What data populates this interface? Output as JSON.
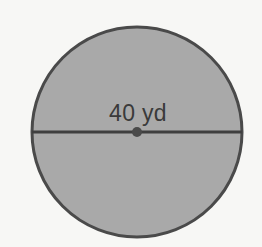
{
  "figure": {
    "type": "circle-diagram",
    "background_color": "#f7f7f5",
    "shape": {
      "name": "circle",
      "fill_color": "#a9a9a9",
      "stroke_color": "#4a4a4a",
      "stroke_width": 3,
      "center_x": 137,
      "center_y": 132,
      "radius": 105
    },
    "diameter_line": {
      "name": "diameter-segment",
      "stroke_color": "#3f3f3f",
      "stroke_width": 3,
      "x1": 32,
      "y1": 132,
      "x2": 242,
      "y2": 132
    },
    "center_point": {
      "name": "center-dot",
      "color": "#4a4a4a",
      "cx": 137,
      "cy": 132,
      "r": 5
    },
    "measurement": {
      "label": "40 yd",
      "value": 40,
      "unit": "yd",
      "quantity": "diameter",
      "text_color": "#3a3a3a",
      "x": 138,
      "y": 121
    }
  }
}
